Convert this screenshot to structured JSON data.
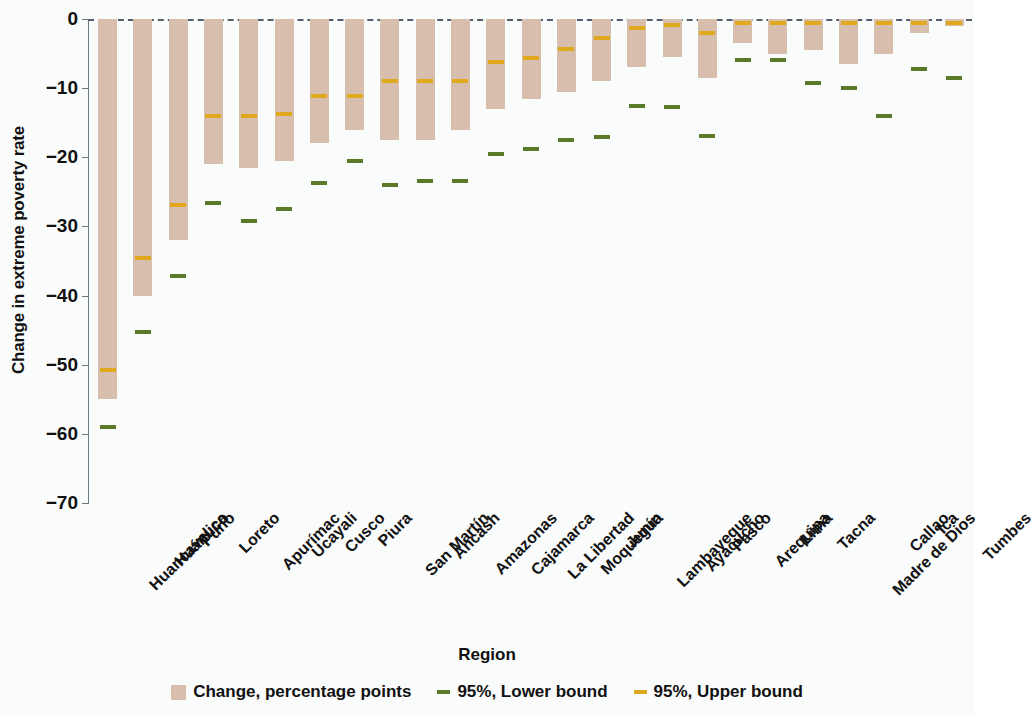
{
  "chart_data": {
    "type": "bar",
    "title": "",
    "xlabel": "Region",
    "ylabel": "Change in extreme poverty rate",
    "ylim": [
      -70,
      0
    ],
    "yticks": [
      0,
      -10,
      -20,
      -30,
      -40,
      -50,
      -60,
      -70
    ],
    "ytick_labels": [
      "0",
      "−10",
      "−20",
      "−30",
      "−40",
      "−50",
      "−60",
      "−70"
    ],
    "grid": false,
    "zero_reference_line": true,
    "legend_position": "bottom",
    "categories": [
      "Huancavelica",
      "Huánuco",
      "Puno",
      "Loreto",
      "Apurímac",
      "Ucayali",
      "Cusco",
      "Piura",
      "San Martín",
      "Ancash",
      "Amazonas",
      "Cajamarca",
      "La Libertad",
      "Moquegua",
      "Junín",
      "Lambayeque",
      "Ayacucho",
      "Pasco",
      "Arequipa",
      "Lima",
      "Tacna",
      "Madre de Dios",
      "Callao",
      "Ica",
      "Tumbes"
    ],
    "series": [
      {
        "name": "Change, percentage points",
        "color": "#d8bfad",
        "kind": "bar",
        "values": [
          -55.0,
          -40.0,
          -32.0,
          -21.0,
          -21.5,
          -20.5,
          -18.0,
          -16.0,
          -17.5,
          -17.5,
          -16.0,
          -13.0,
          -11.5,
          -10.5,
          -9.0,
          -7.0,
          -5.5,
          -8.5,
          -3.5,
          -5.0,
          -4.5,
          -6.5,
          -5.0,
          -2.0,
          -1.0
        ]
      },
      {
        "name": "95%, Upper bound",
        "color": "#e0a81c",
        "kind": "dash",
        "values": [
          -50.8,
          -34.6,
          -26.9,
          -14.0,
          -14.0,
          -13.7,
          -11.2,
          -11.2,
          -9.0,
          -9.0,
          -9.0,
          -6.2,
          -5.7,
          -4.4,
          -2.8,
          -1.3,
          -0.9,
          -2.0,
          -0.6,
          -0.6,
          -0.6,
          -0.6,
          -0.6,
          -0.6,
          -0.6
        ]
      },
      {
        "name": "95%, Lower bound",
        "color": "#5a7a29",
        "kind": "dash",
        "values": [
          -59.0,
          -45.3,
          -37.2,
          -26.6,
          -29.2,
          -27.5,
          -23.7,
          -20.6,
          -24.0,
          -23.4,
          -23.4,
          -19.5,
          -18.8,
          -17.5,
          -17.1,
          -12.6,
          -12.7,
          -16.9,
          -6.0,
          -6.0,
          -9.2,
          -10.0,
          -14.0,
          -7.3,
          -8.5
        ]
      }
    ]
  },
  "legend": {
    "items": [
      {
        "label": "Change, percentage points",
        "glyph": "bar-swatch"
      },
      {
        "label": "95%, Lower bound",
        "glyph": "dash-swatch-green"
      },
      {
        "label": "95%, Upper bound",
        "glyph": "dash-swatch-orange"
      }
    ]
  },
  "axis": {
    "x_title": "Region",
    "y_title": "Change in extreme poverty rate"
  }
}
